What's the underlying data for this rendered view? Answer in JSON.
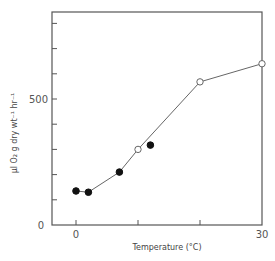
{
  "chart_data": {
    "type": "line",
    "title": "",
    "xlabel": "Temperature (°C)",
    "ylabel": "µl O₂ g dry wt⁻¹ hr⁻¹",
    "xlim": [
      -4,
      30
    ],
    "ylim": [
      0,
      840
    ],
    "x_ticks": [
      0,
      10,
      20,
      30
    ],
    "x_tick_labels": [
      "0",
      "",
      "",
      "30"
    ],
    "y_ticks": [
      0,
      100,
      200,
      300,
      400,
      500,
      600,
      700,
      800
    ],
    "y_tick_labels": [
      "0",
      "",
      "",
      "",
      "",
      "500",
      "",
      "",
      ""
    ],
    "grid": false,
    "legend": null,
    "series": [
      {
        "name": "filled circles",
        "marker": "filled-circle",
        "points": [
          {
            "x": 0,
            "y": 135
          },
          {
            "x": 2,
            "y": 130
          },
          {
            "x": 7,
            "y": 210
          },
          {
            "x": 12,
            "y": 317
          }
        ]
      },
      {
        "name": "open circles",
        "marker": "open-circle",
        "points": [
          {
            "x": 10,
            "y": 300
          },
          {
            "x": 20,
            "y": 568
          },
          {
            "x": 30,
            "y": 640
          }
        ]
      }
    ],
    "connecting_line": [
      {
        "x": 0,
        "y": 135
      },
      {
        "x": 2,
        "y": 130
      },
      {
        "x": 7,
        "y": 210
      },
      {
        "x": 10,
        "y": 300
      },
      {
        "x": 20,
        "y": 568
      },
      {
        "x": 30,
        "y": 640
      }
    ]
  },
  "labels": {
    "x_axis_title": "Temperature (°C)",
    "y_axis_title": "µl O₂ g dry wt⁻¹ hr⁻¹",
    "y_tick_0": "0",
    "y_tick_500": "500",
    "x_tick_0": "0",
    "x_tick_30": "30"
  },
  "colors": {
    "axis": "#555555",
    "line": "#666666",
    "marker_fill": "#111111",
    "open_marker_fill": "#ffffff"
  }
}
